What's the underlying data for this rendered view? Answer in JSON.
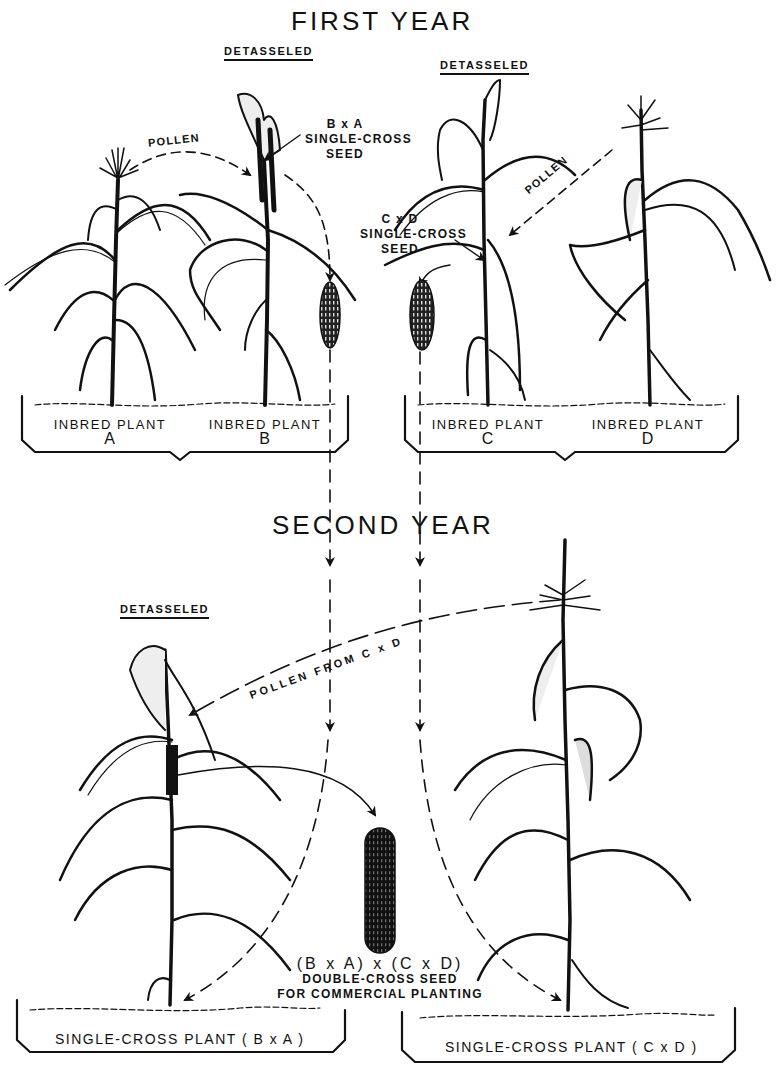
{
  "diagram": {
    "type": "hybrid-corn-breeding-flow",
    "colors": {
      "ink": "#111111",
      "background": "#ffffff"
    },
    "first_year": {
      "title": "FIRST YEAR",
      "left_group": {
        "detasseled_label": "DETASSELED",
        "pollen_label": "POLLEN",
        "seed_label": {
          "cross": "B x A",
          "line1": "SINGLE-CROSS",
          "line2": "SEED"
        },
        "plants": [
          {
            "name": "INBRED PLANT",
            "letter": "A"
          },
          {
            "name": "INBRED PLANT",
            "letter": "B"
          }
        ]
      },
      "right_group": {
        "detasseled_label": "DETASSELED",
        "pollen_label": "POLLEN",
        "seed_label": {
          "cross": "C x D",
          "line1": "SINGLE-CROSS",
          "line2": "SEED"
        },
        "plants": [
          {
            "name": "INBRED PLANT",
            "letter": "C"
          },
          {
            "name": "INBRED PLANT",
            "letter": "D"
          }
        ]
      }
    },
    "second_year": {
      "title": "SECOND YEAR",
      "detasseled_label": "DETASSELED",
      "pollen_label": "POLLEN FROM C x D",
      "double_cross": {
        "formula": "(B x A) x (C x D)",
        "line1": "DOUBLE-CROSS SEED",
        "line2": "FOR COMMERCIAL PLANTING"
      },
      "plants": [
        {
          "label": "SINGLE-CROSS PLANT ( B x A )"
        },
        {
          "label": "SINGLE-CROSS PLANT ( C x D )"
        }
      ]
    }
  }
}
